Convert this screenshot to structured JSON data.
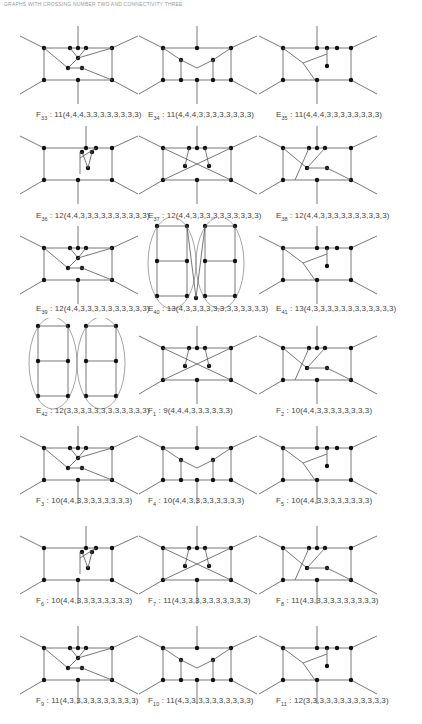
{
  "header": {
    "text": "GRAPHS WITH CROSSING NUMBER TWO AND CONNECTIVITY THREE"
  },
  "figures": [
    {
      "prefix": "F",
      "sub": "33",
      "formula": "11(4,4,4,3,3,3,3,3,3,3,3)"
    },
    {
      "prefix": "E",
      "sub": "34",
      "formula": "11(4,4,4,3,3,3,3,3,3,3,3)"
    },
    {
      "prefix": "E",
      "sub": "35",
      "formula": "11(4,4,4,3,3,3,3,3,3,3,3)"
    },
    {
      "prefix": "E",
      "sub": "36",
      "formula": "12(4,4,3,3,3,3,3,3,3,3,3,3)"
    },
    {
      "prefix": "E",
      "sub": "37",
      "formula": "12(4,4,3,3,3,3,3,3,3,3,3,3)"
    },
    {
      "prefix": "E",
      "sub": "38",
      "formula": "12(4,4,3,3,3,3,3,3,3,3,3,3)"
    },
    {
      "prefix": "E",
      "sub": "39",
      "formula": "12(4,4,3,3,3,3,3,3,3,3,3,3)"
    },
    {
      "prefix": "E",
      "sub": "40",
      "formula": "13(4,3,3,3,3,3,3,3,3,3,3,3,3)"
    },
    {
      "prefix": "E",
      "sub": "41",
      "formula": "13(4,3,3,3,3,3,3,3,3,3,3,3,3)"
    },
    {
      "prefix": "E",
      "sub": "42",
      "formula": "12(3,3,3,3,3,3,3,3,3,3,3,3)"
    },
    {
      "prefix": "F",
      "sub": "1",
      "formula": "9(4,4,4,3,3,3,3,3,3)"
    },
    {
      "prefix": "F",
      "sub": "2",
      "formula": "10(4,4,3,3,3,3,3,3,3,3)"
    },
    {
      "prefix": "F",
      "sub": "3",
      "formula": "10(4,4,3,3,3,3,3,3,3,3)"
    },
    {
      "prefix": "F",
      "sub": "4",
      "formula": "10(4,4,3,3,3,3,3,3,3,3)"
    },
    {
      "prefix": "F",
      "sub": "5",
      "formula": "10(4,4,3,3,3,3,3,3,3,3)"
    },
    {
      "prefix": "F",
      "sub": "6",
      "formula": "10(4,4,3,3,3,3,3,3,3,3)"
    },
    {
      "prefix": "F",
      "sub": "7",
      "formula": "11(4,3,3,3,3,3,3,3,3,3,3)"
    },
    {
      "prefix": "F",
      "sub": "8",
      "formula": "11(4,3,3,3,3,3,3,3,3,3,3)"
    },
    {
      "prefix": "F",
      "sub": "9",
      "formula": "11(4,3,3,3,3,3,3,3,3,3,3)"
    },
    {
      "prefix": "F",
      "sub": "10",
      "formula": "11(4,3,3,3,3,3,3,3,3,3,3)"
    },
    {
      "prefix": "F",
      "sub": "11",
      "formula": "12(3,3,3,3,3,3,3,3,3,3,3,3)"
    }
  ],
  "separator": " : "
}
